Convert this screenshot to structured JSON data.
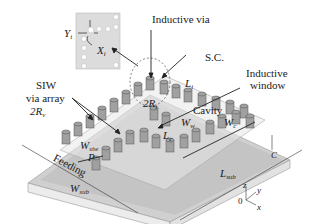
{
  "diagram": {
    "type": "3D schematic",
    "colors": {
      "substrate_top": "#c9c9c9",
      "substrate_side": "#e6e6e6",
      "via_fill": "#9a9a9a",
      "via_stroke": "#555555",
      "arrow": "#222222",
      "inset_bg": "#dcdcdc"
    },
    "labels": {
      "inductive_via": "Inductive via",
      "sc": "S.C.",
      "inductive_window_line1": "Inductive",
      "inductive_window_line2": "window",
      "siw_line1": "SIW",
      "siw_line2": "via array",
      "two_rv": "2R",
      "two_rv_sub": "v",
      "two_ri": "2R",
      "two_ri_sub": "i",
      "l_i": "L",
      "l_i_sub": "i",
      "cavity": "Cavity",
      "w_w": "W",
      "w_w_sub": "w",
      "w_c": "W",
      "w_c_sub": "c",
      "l_c": "L",
      "l_c_sub": "c",
      "w_siw": "W",
      "w_siw_sub": "siw",
      "p": "P",
      "feeding": "Feeding",
      "w_sub": "W",
      "w_sub_sub": "sub",
      "l_sub": "L",
      "l_sub_sub": "sub",
      "c": "C",
      "inset_y": "Y",
      "inset_y_sub": "i",
      "inset_x": "X",
      "inset_x_sub": "i"
    },
    "axes": {
      "z": "z",
      "y": "y",
      "x": "x",
      "origin": "0"
    }
  }
}
